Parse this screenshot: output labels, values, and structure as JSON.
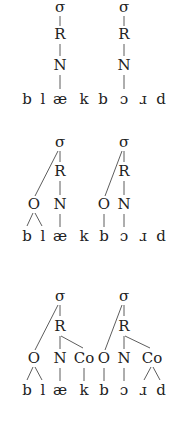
{
  "diagrams": [
    {
      "id": "flat",
      "segments": [
        "b",
        "l",
        "æ",
        "k",
        "b",
        "ɔ",
        "ɹ",
        "d"
      ],
      "syllables": [
        {
          "sigma": "σ",
          "rhyme": "R",
          "nucleus": "N"
        },
        {
          "sigma": "σ",
          "rhyme": "R",
          "nucleus": "N"
        }
      ]
    },
    {
      "id": "with-onset",
      "segments": [
        "b",
        "l",
        "æ",
        "k",
        "b",
        "ɔ",
        "ɹ",
        "d"
      ],
      "syllables": [
        {
          "sigma": "σ",
          "rhyme": "R",
          "onset": "O",
          "nucleus": "N"
        },
        {
          "sigma": "σ",
          "rhyme": "R",
          "onset": "O",
          "nucleus": "N"
        }
      ]
    },
    {
      "id": "full",
      "segments": [
        "b",
        "l",
        "æ",
        "k",
        "b",
        "ɔ",
        "ɹ",
        "d"
      ],
      "syllables": [
        {
          "sigma": "σ",
          "rhyme": "R",
          "onset": "O",
          "nucleus": "N",
          "coda": "Co"
        },
        {
          "sigma": "σ",
          "rhyme": "R",
          "onset": "O",
          "nucleus": "N",
          "coda": "Co"
        }
      ]
    }
  ],
  "colors": {
    "text": "#222222",
    "lines": "#333333",
    "background": "#ffffff"
  }
}
